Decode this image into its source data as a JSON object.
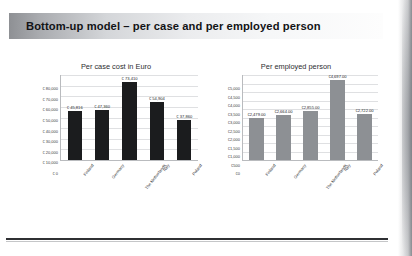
{
  "slide": {
    "title": "Bottom-up model – per case and per employed person"
  },
  "chart_data": [
    {
      "type": "bar",
      "title": "Per case cost in Euro",
      "xlabel": "",
      "ylabel": "",
      "categories": [
        "Finland",
        "Germany",
        "The Netherlands",
        "Italy",
        "Poland"
      ],
      "values": [
        45816,
        47360,
        73410,
        54904,
        37860
      ],
      "value_labels": [
        "€ 45,816",
        "€ 47,360",
        "€ 73,410",
        "€ 54,904",
        "€ 37,860"
      ],
      "ylim": [
        0,
        80000
      ],
      "yticks": [
        0,
        10000,
        20000,
        30000,
        40000,
        50000,
        60000,
        70000,
        80000
      ],
      "ytick_labels": [
        "€ 0",
        "€ 10,000",
        "€ 20,000",
        "€ 30,000",
        "€ 40,000",
        "€ 50,000",
        "€ 60,000",
        "€ 70,000",
        "€ 80,000"
      ],
      "bar_color": "#1b1c1e",
      "grid": true,
      "legend": "none"
    },
    {
      "type": "bar",
      "title": "Per employed person",
      "xlabel": "",
      "ylabel": "",
      "categories": [
        "Finland",
        "Germany",
        "The Netherlands",
        "Italy",
        "Poland"
      ],
      "values": [
        2479,
        2664,
        2855,
        4697,
        2722
      ],
      "value_labels": [
        "€2,479.00",
        "€2,664.00",
        "€2,855.00",
        "€4,697.00",
        "€2,722.00"
      ],
      "ylim": [
        0,
        5000
      ],
      "yticks": [
        0,
        500,
        1000,
        1500,
        2000,
        2500,
        3000,
        3500,
        4000,
        4500,
        5000
      ],
      "ytick_labels": [
        "€0",
        "€500",
        "€1,000",
        "€1,500",
        "€2,000",
        "€2,500",
        "€3,000",
        "€3,500",
        "€4,000",
        "€4,500",
        "€5,000"
      ],
      "bar_color": "#8d9094",
      "grid": true,
      "legend": "none"
    }
  ]
}
